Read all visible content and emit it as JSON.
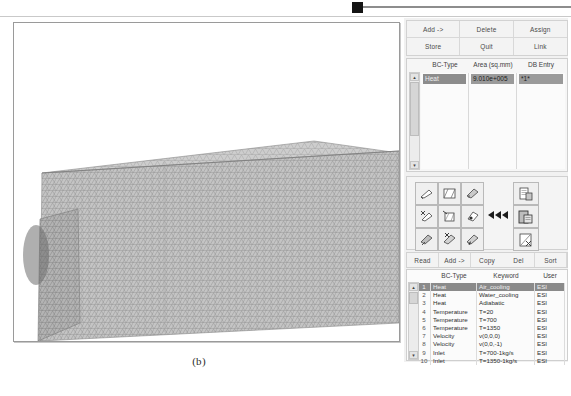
{
  "figure": {
    "caption": "(b)"
  },
  "viewport": {
    "name": "3d-mesh-viewport",
    "content_description": "triangular surface mesh of an extruded rectangular block",
    "mesh_color": "#b9b9b9",
    "background": "#ffffff"
  },
  "panel": {
    "title": "Boundary Condition Panel",
    "top_buttons": [
      {
        "label": "Add ->"
      },
      {
        "label": "Delete"
      },
      {
        "label": "Assign"
      },
      {
        "label": "Store"
      },
      {
        "label": "Quit"
      },
      {
        "label": "Link"
      }
    ],
    "bc_list": {
      "columns": [
        "BC-Type",
        "Area (sq.mm)",
        "DB Entry"
      ],
      "rows": [
        {
          "bc_type": "Heat",
          "area": "9.010e+005",
          "db_entry": "*1*",
          "selected": true
        }
      ],
      "row_marker": "▸"
    },
    "toolbar": {
      "icons": [
        "surface-pick-icon",
        "surface-box-icon",
        "surface-shade-icon",
        "surface-cut-icon",
        "surface-edit-icon",
        "volume-point-icon",
        "surface-fill-icon",
        "surface-delete-icon",
        "surface-assign-icon"
      ],
      "arrow_icon": "triple-left-arrow-icon",
      "right_icons": [
        "copy-page-icon",
        "paste-page-icon",
        "clear-page-icon"
      ]
    },
    "table_buttons": [
      {
        "label": "Read"
      },
      {
        "label": "Add ->"
      },
      {
        "label": "Copy"
      },
      {
        "label": "Del"
      },
      {
        "label": "Sort"
      }
    ],
    "db_table": {
      "columns": [
        "BC-Type",
        "Keyword",
        "User"
      ],
      "rows": [
        {
          "n": "1",
          "bc_type": "Heat",
          "keyword": "Air_cooling",
          "user": "ESI",
          "selected": true
        },
        {
          "n": "2",
          "bc_type": "Heat",
          "keyword": "Water_cooling",
          "user": "ESI",
          "selected": false
        },
        {
          "n": "3",
          "bc_type": "Heat",
          "keyword": "Adiabatic",
          "user": "ESI",
          "selected": false
        },
        {
          "n": "4",
          "bc_type": "Temperature",
          "keyword": "T=20",
          "user": "ESI",
          "selected": false
        },
        {
          "n": "5",
          "bc_type": "Temperature",
          "keyword": "T=700",
          "user": "ESI",
          "selected": false
        },
        {
          "n": "6",
          "bc_type": "Temperature",
          "keyword": "T=1350",
          "user": "ESI",
          "selected": false
        },
        {
          "n": "7",
          "bc_type": "Velocity",
          "keyword": "v(0,0,0)",
          "user": "ESI",
          "selected": false
        },
        {
          "n": "8",
          "bc_type": "Velocity",
          "keyword": "v(0,0,-1)",
          "user": "ESI",
          "selected": false
        },
        {
          "n": "9",
          "bc_type": "Inlet",
          "keyword": "T=700-1kg/s",
          "user": "ESI",
          "selected": false
        },
        {
          "n": "10",
          "bc_type": "Inlet",
          "keyword": "T=1350-1kg/s",
          "user": "ESI",
          "selected": false
        }
      ]
    },
    "scroll_up_glyph": "▴",
    "scroll_down_glyph": "▾"
  },
  "colors": {
    "panel_bg": "#f1f1f1",
    "selection": "#8a8a8a",
    "border": "#cfcfcf",
    "marker": "#141414"
  }
}
